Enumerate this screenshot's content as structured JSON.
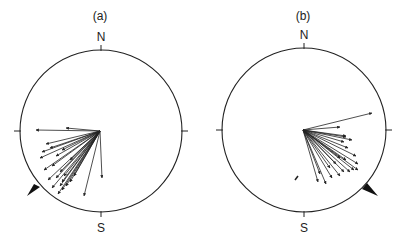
{
  "panels": [
    {
      "label": "(a)",
      "north": "N",
      "south": "S",
      "center": [
        101,
        131
      ],
      "radius": 81,
      "origin": [
        100,
        131
      ],
      "vectors": [
        [
          36,
          130
        ],
        [
          66,
          128
        ],
        [
          46,
          144
        ],
        [
          50,
          148
        ],
        [
          42,
          152
        ],
        [
          40,
          158
        ],
        [
          56,
          156
        ],
        [
          52,
          166
        ],
        [
          44,
          170
        ],
        [
          60,
          172
        ],
        [
          48,
          180
        ],
        [
          62,
          182
        ],
        [
          52,
          188
        ],
        [
          58,
          194
        ],
        [
          62,
          190
        ],
        [
          66,
          186
        ],
        [
          70,
          182
        ],
        [
          74,
          176
        ],
        [
          64,
          176
        ],
        [
          56,
          178
        ],
        [
          84,
          196
        ],
        [
          102,
          178
        ],
        [
          62,
          150
        ],
        [
          70,
          160
        ],
        [
          60,
          186
        ]
      ],
      "arrowhead_marker": {
        "points": "27,196 40,187 34,184"
      }
    },
    {
      "label": "(b)",
      "north": "N",
      "south": "S",
      "center": [
        304,
        130
      ],
      "radius": 82,
      "origin": [
        303,
        130
      ],
      "vectors": [
        [
          372,
          113
        ],
        [
          340,
          127
        ],
        [
          346,
          136
        ],
        [
          352,
          140
        ],
        [
          346,
          137
        ],
        [
          344,
          142
        ],
        [
          348,
          148
        ],
        [
          356,
          156
        ],
        [
          346,
          160
        ],
        [
          358,
          164
        ],
        [
          354,
          170
        ],
        [
          350,
          172
        ],
        [
          344,
          172
        ],
        [
          340,
          176
        ],
        [
          358,
          170
        ],
        [
          332,
          178
        ],
        [
          326,
          184
        ],
        [
          318,
          182
        ],
        [
          330,
          168
        ],
        [
          336,
          164
        ],
        [
          340,
          158
        ],
        [
          320,
          174
        ]
      ],
      "stray_mark": [
        297,
        178
      ],
      "arrowhead_marker": {
        "points": "378,196 367,183 362,189"
      }
    }
  ]
}
